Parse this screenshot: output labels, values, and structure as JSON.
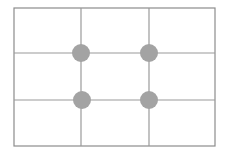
{
  "diagram": {
    "frame": {
      "x": 14,
      "y": 8,
      "width": 201,
      "height": 138
    },
    "vertical_lines_x": [
      81,
      149
    ],
    "horizontal_lines_y": [
      53,
      100
    ],
    "intersection_points": [
      {
        "x": 81,
        "y": 53
      },
      {
        "x": 149,
        "y": 53
      },
      {
        "x": 82,
        "y": 100
      },
      {
        "x": 149,
        "y": 100
      }
    ],
    "point_radius": 9,
    "colors": {
      "background": "#ffffff",
      "frame": "#8c8c8c",
      "grid_line": "#9a9a9a",
      "point": "#a3a3a3"
    }
  }
}
